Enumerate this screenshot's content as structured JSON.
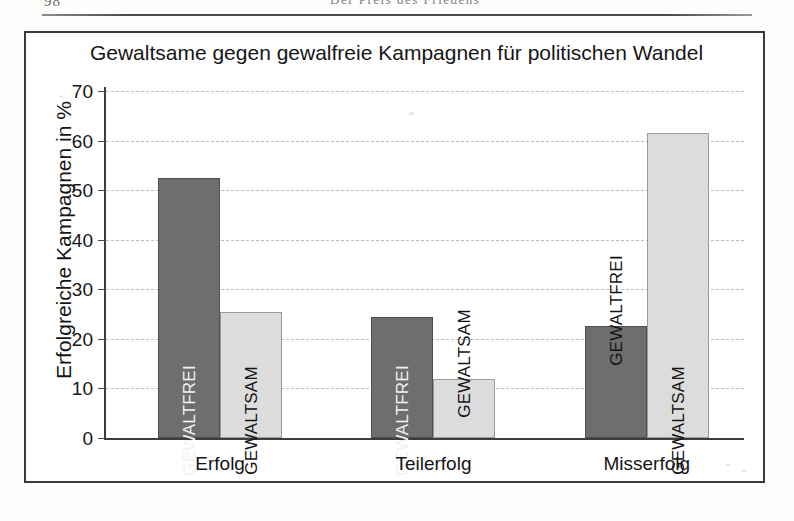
{
  "page": {
    "folio": "98",
    "running_head": "Der Preis des Friedens"
  },
  "figure": {
    "title": "Gewaltsame gegen gewalfreie Kampagnen für politischen Wandel"
  },
  "chart_data": {
    "type": "bar",
    "title": "Gewaltsame gegen gewalfreie Kampagnen für politischen Wandel",
    "xlabel": "",
    "ylabel": "Erfolgreiche Kampagnen in %",
    "ylim": [
      0,
      70
    ],
    "ytick_step": 10,
    "yticks": [
      "70",
      "60",
      "50",
      "40",
      "30",
      "20",
      "10",
      "0"
    ],
    "grid": true,
    "legend": "none",
    "bar_labels_inline": true,
    "categories": [
      "Erfolg",
      "Teilerfolg",
      "Misserfolg"
    ],
    "series": [
      {
        "name": "GEWALTFREI",
        "color": "#6e6e6e",
        "values": [
          52.5,
          24.5,
          22.5
        ]
      },
      {
        "name": "GEWALTSAM",
        "color": "#dcdcdc",
        "values": [
          25.5,
          12.0,
          61.5
        ]
      }
    ]
  }
}
